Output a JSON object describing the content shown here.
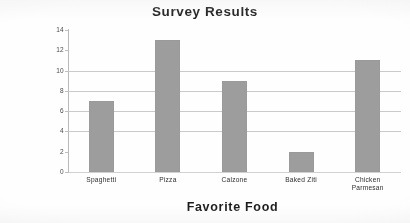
{
  "chart_data": {
    "type": "bar",
    "title": "Survey Results",
    "xlabel": "Favorite Food",
    "ylabel": "No. of Votes",
    "categories": [
      "Spaghetti",
      "Pizza",
      "Calzone",
      "Baked Ziti",
      "Chicken Parmesan"
    ],
    "values": [
      7,
      13,
      9,
      2,
      11
    ],
    "ylim": [
      0,
      14
    ],
    "ytick_labels": [
      "14",
      "12",
      "10",
      "8",
      "6",
      "4",
      "2",
      "0"
    ],
    "ytick_values": [
      14,
      12,
      10,
      8,
      6,
      4,
      2,
      0
    ],
    "gridlines": [
      4,
      6,
      8,
      10
    ],
    "grid": true,
    "legend": "none",
    "bar_color": "#9c9c9c",
    "text_color": "#1c1c1c",
    "gridline_color": "#c9c9c9",
    "axis_color": "#b9b9b9",
    "background_color": "#fcfcfc"
  },
  "labels": {
    "category_lines": [
      [
        "Spaghetti"
      ],
      [
        "Pizza"
      ],
      [
        "Calzone"
      ],
      [
        "Baked Ziti"
      ],
      [
        "Chicken",
        "Parmesan"
      ]
    ]
  }
}
